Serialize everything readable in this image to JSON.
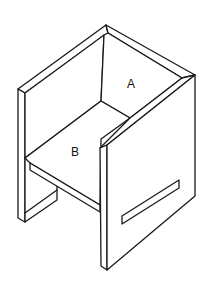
{
  "figure": {
    "labels": {
      "a": "A",
      "b": "B"
    },
    "colors": {
      "stroke": "#1a1a1a",
      "background": "#ffffff"
    }
  }
}
